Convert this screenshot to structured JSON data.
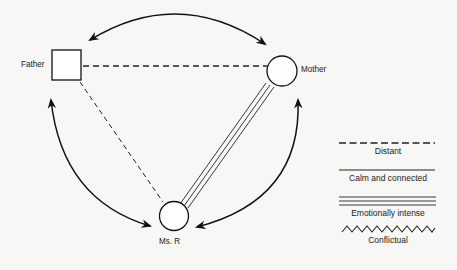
{
  "diagram": {
    "type": "family relationship diagram",
    "nodes": [
      {
        "id": "father",
        "label": "Father",
        "shape": "square"
      },
      {
        "id": "mother",
        "label": "Mother",
        "shape": "circle"
      },
      {
        "id": "ms_r",
        "label": "Ms. R",
        "shape": "circle"
      }
    ],
    "edges": [
      {
        "from": "father",
        "to": "mother",
        "style": "Distant"
      },
      {
        "from": "father",
        "to": "ms_r",
        "style": "Distant"
      },
      {
        "from": "mother",
        "to": "ms_r",
        "style": "Emotionally intense"
      }
    ],
    "arrows": [
      {
        "between": [
          "father",
          "mother"
        ],
        "type": "bidirectional curved"
      },
      {
        "between": [
          "father",
          "ms_r"
        ],
        "type": "bidirectional curved"
      },
      {
        "between": [
          "mother",
          "ms_r"
        ],
        "type": "bidirectional curved"
      }
    ]
  },
  "labels": {
    "father": "Father",
    "mother": "Mother",
    "ms_r": "Ms. R"
  },
  "legend": {
    "distant": "Distant",
    "calm": "Calm and connected",
    "intense": "Emotionally intense",
    "conflictual": "Conflictual"
  }
}
